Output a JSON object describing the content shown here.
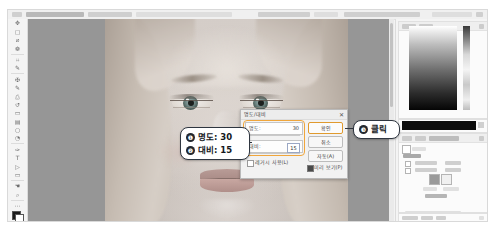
{
  "app": {
    "name": "Adobe Photoshop",
    "document_title": "명도/대비 조정"
  },
  "toolbar": {
    "name": "tools-panel",
    "tools": [
      {
        "name": "move-tool",
        "glyph": "✥"
      },
      {
        "name": "marquee-tool",
        "glyph": "▢"
      },
      {
        "name": "lasso-tool",
        "glyph": "⌀"
      },
      {
        "name": "quick-selection-tool",
        "glyph": "❁"
      },
      {
        "name": "crop-tool",
        "glyph": "⌗"
      },
      {
        "name": "eyedropper-tool",
        "glyph": "✒"
      },
      {
        "name": "spot-healing-tool",
        "glyph": "✠"
      },
      {
        "name": "brush-tool",
        "glyph": "✎"
      },
      {
        "name": "clone-stamp-tool",
        "glyph": "⎙"
      },
      {
        "name": "history-brush-tool",
        "glyph": "↺"
      },
      {
        "name": "eraser-tool",
        "glyph": "▭"
      },
      {
        "name": "gradient-tool",
        "glyph": "▤"
      },
      {
        "name": "blur-tool",
        "glyph": "○"
      },
      {
        "name": "dodge-tool",
        "glyph": "◔"
      },
      {
        "name": "pen-tool",
        "glyph": "✑"
      },
      {
        "name": "type-tool",
        "glyph": "T"
      },
      {
        "name": "path-selection-tool",
        "glyph": "▷"
      },
      {
        "name": "rectangle-tool",
        "glyph": "▭"
      },
      {
        "name": "hand-tool",
        "glyph": "✋"
      },
      {
        "name": "zoom-tool",
        "glyph": "⌕"
      },
      {
        "name": "more-tools",
        "glyph": "⋯"
      },
      {
        "name": "edit-toolbar",
        "glyph": "⋮"
      }
    ]
  },
  "canvas": {
    "name": "image-canvas",
    "image_subject": "인물 사진 (여성 얼굴 클로즈업)"
  },
  "dialog": {
    "title": "명도/대비",
    "close_glyph": "✕",
    "fields": [
      {
        "label": "명도:",
        "value": "30",
        "name": "brightness"
      },
      {
        "label": "대비:",
        "value": "15",
        "name": "contrast"
      }
    ],
    "legacy_checkbox": {
      "label": "레거시 사용(L)",
      "checked": false
    },
    "preview_checkbox": {
      "label": "미리 보기(P)",
      "checked": true
    },
    "buttons": [
      {
        "label": "확인",
        "name": "ok"
      },
      {
        "label": "취소",
        "name": "cancel"
      },
      {
        "label": "자동(A)",
        "name": "auto"
      }
    ]
  },
  "annotations": {
    "group_a": [
      {
        "badge": "❶",
        "text": "명도: 30"
      },
      {
        "badge": "❷",
        "text": "대비: 15"
      }
    ],
    "group_b": {
      "badge": "❸",
      "text": "클릭"
    }
  },
  "panels": {
    "navigator": {
      "name": "navigator-panel",
      "tabs": [
        "색상",
        "견본"
      ]
    },
    "properties": {
      "name": "properties-panel",
      "tabs": [
        "조정",
        "라이브러리"
      ]
    },
    "layers": {
      "name": "layers-panel",
      "tabs": [
        "레이어",
        "채널",
        "패스"
      ]
    }
  },
  "colors": {
    "accent_orange": "#f0a63c",
    "badge_dark": "#22272e",
    "canvas_gray": "#969696",
    "panel_bg": "#f4f4f4"
  }
}
